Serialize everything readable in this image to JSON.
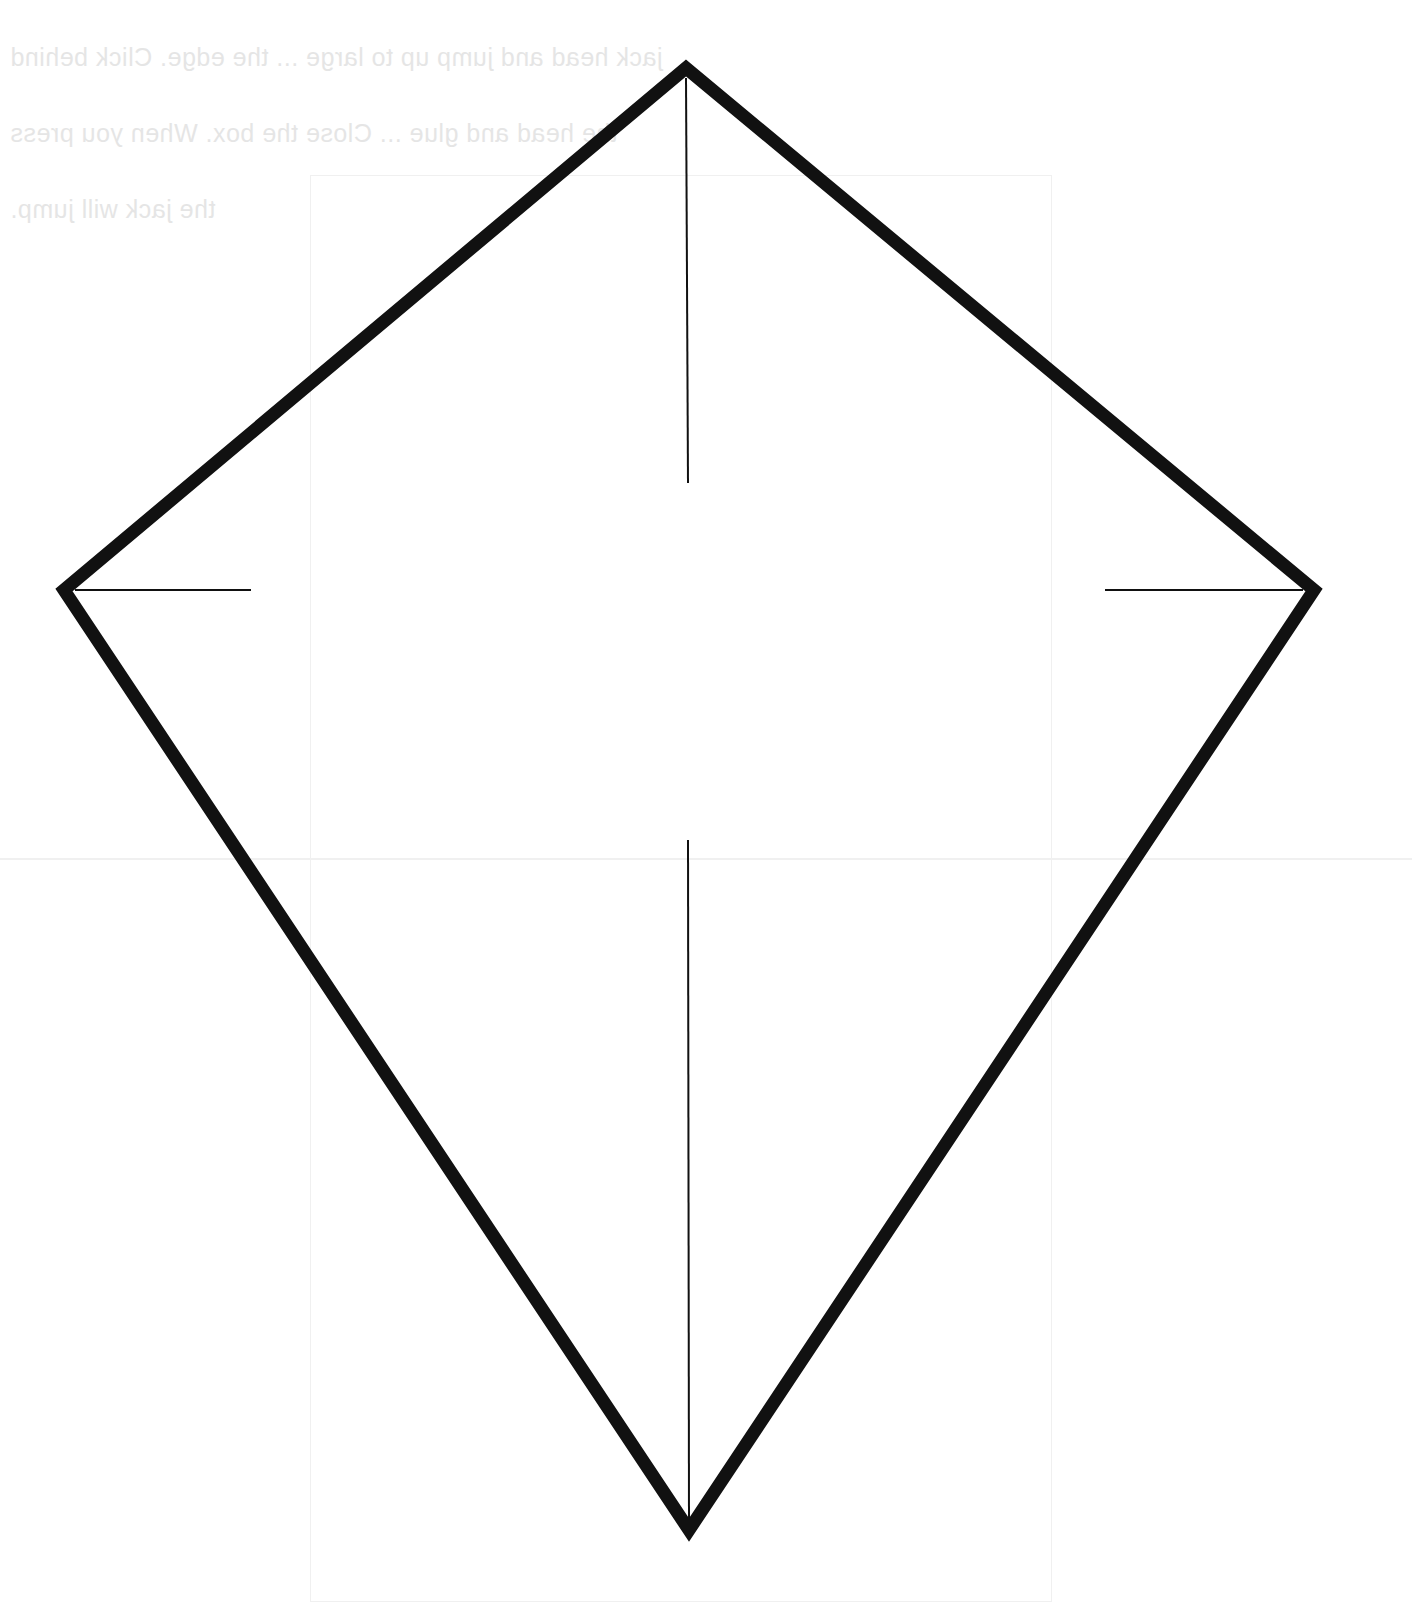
{
  "page": {
    "background": "#ffffff"
  },
  "bleed_through_text": {
    "lines": [
      "jack head and jump up to large ... the edge. Click behind",
      "the head and glue ... Close the box. When you press",
      "the jack will jump."
    ],
    "color": "#d8d8d8"
  },
  "kite": {
    "stroke_color": "#111111",
    "outline_width": 13,
    "guide_width": 2,
    "vertices": {
      "top": [
        686,
        68
      ],
      "left": [
        64,
        590
      ],
      "right": [
        1314,
        590
      ],
      "bottom": [
        689,
        1530
      ]
    },
    "guides": {
      "spine_upper": [
        [
          686,
          78
        ],
        [
          688,
          483
        ]
      ],
      "spine_lower": [
        [
          688,
          840
        ],
        [
          689,
          1520
        ]
      ],
      "left_tick": [
        [
          75,
          590
        ],
        [
          251,
          590
        ]
      ],
      "right_tick": [
        [
          1105,
          590
        ],
        [
          1303,
          590
        ]
      ]
    }
  }
}
